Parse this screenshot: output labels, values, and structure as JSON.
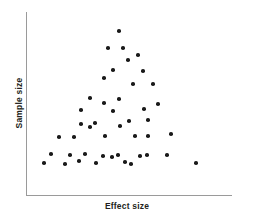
{
  "figure": {
    "background_color": "#ffffff",
    "axis_color": "#9a9a9a",
    "point_color": "#1a1a1a",
    "text_color": "#231f20"
  },
  "chart_data": {
    "type": "scatter",
    "title": "",
    "xlabel": "Effect size",
    "ylabel": "Sample size",
    "grid": false,
    "legend": "none",
    "axis_ticks": {
      "x": [],
      "y": []
    },
    "xlim": [
      0,
      1
    ],
    "ylim": [
      0,
      1
    ],
    "marker": {
      "shape": "circle",
      "color": "#1a1a1a",
      "size": 3.6
    },
    "n_points": 45,
    "points": [
      {
        "px": 119,
        "py": 31,
        "x": 0.451,
        "y": 0.895
      },
      {
        "px": 108,
        "py": 48,
        "x": 0.398,
        "y": 0.802
      },
      {
        "px": 123,
        "py": 48,
        "x": 0.471,
        "y": 0.802
      },
      {
        "px": 138,
        "py": 55,
        "x": 0.544,
        "y": 0.764
      },
      {
        "px": 128,
        "py": 60,
        "x": 0.495,
        "y": 0.736
      },
      {
        "px": 113,
        "py": 70,
        "x": 0.422,
        "y": 0.681
      },
      {
        "px": 143,
        "py": 71,
        "x": 0.568,
        "y": 0.676
      },
      {
        "px": 104,
        "py": 78,
        "px_note": "",
        "x": 0.379,
        "y": 0.637
      },
      {
        "px": 133,
        "py": 84,
        "x": 0.519,
        "y": 0.604
      },
      {
        "px": 153,
        "py": 84,
        "x": 0.617,
        "y": 0.604
      },
      {
        "px": 90,
        "py": 98,
        "x": 0.311,
        "y": 0.527
      },
      {
        "px": 104,
        "py": 103,
        "x": 0.379,
        "y": 0.5
      },
      {
        "px": 119,
        "py": 99,
        "x": 0.451,
        "y": 0.522
      },
      {
        "px": 158,
        "py": 104,
        "x": 0.641,
        "y": 0.495
      },
      {
        "px": 144,
        "py": 109,
        "x": 0.573,
        "y": 0.467
      },
      {
        "px": 81,
        "py": 110,
        "x": 0.267,
        "y": 0.462
      },
      {
        "px": 95,
        "py": 123,
        "x": 0.335,
        "y": 0.39
      },
      {
        "px": 81,
        "py": 124,
        "x": 0.267,
        "y": 0.385
      },
      {
        "px": 120,
        "py": 126,
        "x": 0.456,
        "y": 0.374
      },
      {
        "px": 129,
        "py": 121,
        "x": 0.5,
        "y": 0.401
      },
      {
        "px": 59,
        "py": 137,
        "x": 0.16,
        "y": 0.313
      },
      {
        "px": 74,
        "py": 137,
        "x": 0.233,
        "y": 0.313
      },
      {
        "px": 105,
        "py": 136,
        "x": 0.384,
        "y": 0.319
      },
      {
        "px": 135,
        "py": 136,
        "x": 0.529,
        "y": 0.319
      },
      {
        "px": 148,
        "py": 136,
        "x": 0.592,
        "y": 0.319
      },
      {
        "px": 171,
        "py": 134,
        "x": 0.704,
        "y": 0.33
      },
      {
        "px": 51,
        "py": 154,
        "x": 0.121,
        "y": 0.22
      },
      {
        "px": 44,
        "py": 163,
        "x": 0.087,
        "y": 0.17
      },
      {
        "px": 65,
        "py": 164,
        "x": 0.189,
        "y": 0.165
      },
      {
        "px": 70,
        "py": 155,
        "x": 0.214,
        "y": 0.214
      },
      {
        "px": 79,
        "py": 161,
        "x": 0.257,
        "y": 0.181
      },
      {
        "px": 85,
        "py": 154,
        "x": 0.286,
        "y": 0.22
      },
      {
        "px": 96,
        "py": 163,
        "x": 0.34,
        "y": 0.17
      },
      {
        "px": 103,
        "py": 156,
        "x": 0.374,
        "y": 0.209
      },
      {
        "px": 112,
        "py": 157,
        "x": 0.417,
        "y": 0.203
      },
      {
        "px": 118,
        "py": 155,
        "x": 0.447,
        "y": 0.214
      },
      {
        "px": 125,
        "py": 162,
        "x": 0.481,
        "y": 0.176
      },
      {
        "px": 131,
        "py": 164,
        "x": 0.51,
        "y": 0.165
      },
      {
        "px": 140,
        "py": 156,
        "x": 0.553,
        "y": 0.209
      },
      {
        "px": 147,
        "py": 155,
        "x": 0.587,
        "y": 0.214
      },
      {
        "px": 167,
        "py": 155,
        "x": 0.684,
        "y": 0.214
      },
      {
        "px": 196,
        "py": 163,
        "x": 0.825,
        "y": 0.17
      },
      {
        "px": 90,
        "py": 127,
        "x": 0.311,
        "y": 0.368
      },
      {
        "px": 113,
        "py": 111,
        "x": 0.422,
        "y": 0.456
      },
      {
        "px": 148,
        "py": 120,
        "x": 0.592,
        "y": 0.407
      }
    ]
  }
}
